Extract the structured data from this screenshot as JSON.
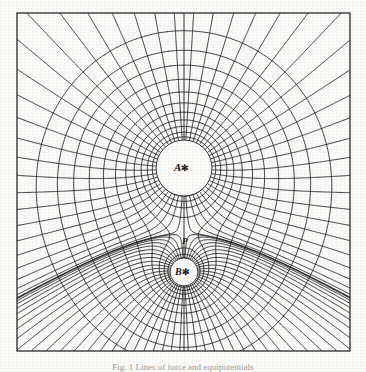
{
  "figure": {
    "caption": "Fig. 1 Lines of force and equipotentials",
    "background_color": "#fbfbf9",
    "ink_color": "#1a1a1a",
    "frame": {
      "x": 17,
      "y": 13,
      "width": 333,
      "height": 338,
      "stroke": "#2b2b2b",
      "stroke_width": 1.3
    }
  },
  "labels": {
    "source_a": "A",
    "source_b": "B",
    "neutral_point": "P",
    "charge_glyph": "✻"
  },
  "chart_data": {
    "type": "line",
    "xlabel": "",
    "ylabel": "",
    "xlim": [
      17,
      350
    ],
    "ylim": [
      13,
      351
    ],
    "grid": false,
    "legend": null,
    "annotations": [
      {
        "text": "A",
        "x": 184,
        "y": 168,
        "note": "stronger source, large circular cavity"
      },
      {
        "text": "B",
        "x": 184,
        "y": 272,
        "note": "weaker source, small circular cavity"
      },
      {
        "text": "P",
        "x": 184,
        "y": 241,
        "note": "neutral / saddle point between A and B"
      }
    ],
    "sources": [
      {
        "name": "A",
        "x": 184,
        "y": 168,
        "strength": 3.0,
        "cavity_radius": 28
      },
      {
        "name": "B",
        "x": 184,
        "y": 272,
        "strength": 1.0,
        "cavity_radius": 14
      }
    ],
    "neutral_point": {
      "x": 184,
      "y": 241
    },
    "equipotential_levels": [
      0.026,
      0.03,
      0.034,
      0.039,
      0.045,
      0.052,
      0.06,
      0.069,
      0.079,
      0.091,
      0.104,
      0.12,
      0.138,
      0.158,
      0.182,
      0.209,
      0.24,
      0.276,
      0.317,
      0.364,
      0.419,
      0.481,
      0.553,
      0.636,
      0.731,
      0.84,
      0.966,
      1.11,
      1.276,
      1.467,
      1.686,
      1.938,
      2.228,
      2.561,
      2.945,
      3.385,
      3.891,
      4.473,
      5.142,
      5.911,
      6.795,
      7.811,
      8.979,
      10.322
    ],
    "flux_line_count": 48,
    "axis_line": {
      "x": 184,
      "y0": 13,
      "y1": 351,
      "note": "vertical axis of symmetry through A, P and B"
    },
    "series": [
      {
        "name": "equipotentials",
        "style": "closed curves",
        "count": 44
      },
      {
        "name": "lines of force",
        "style": "radial orthogonal trajectories",
        "count": 48
      }
    ]
  }
}
